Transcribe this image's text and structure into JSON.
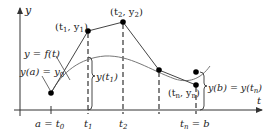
{
  "diagram": {
    "type": "euler-method-illustration",
    "axes": {
      "y_label": "y",
      "x_label": "t"
    },
    "ticks": {
      "t0": "a = t",
      "t0_sub": "0",
      "t1": "t",
      "t1_sub": "1",
      "t2": "t",
      "t2_sub": "2",
      "tn": "t",
      "tn_sub": "n",
      "tn_suffix": " = b"
    },
    "labels": {
      "curve": "y = f(t)",
      "initial": "y(a) = y",
      "initial_sub": "0",
      "point1": "(t",
      "point1_sub1": "1",
      "point1_mid": ", y",
      "point1_sub2": "1",
      "point1_end": ")",
      "point2": "(t",
      "point2_sub1": "2",
      "point2_mid": ", y",
      "point2_sub2": "2",
      "point2_end": ")",
      "pointn": "(t",
      "pointn_sub1": "n",
      "pointn_mid": ", y",
      "pointn_sub2": "n",
      "pointn_end": ")",
      "brace1": "y(t",
      "brace1_sub": "1",
      "brace1_end": ")",
      "brace_end": "y(b) = y(t",
      "brace_end_sub": "n",
      "brace_end_end": ")"
    },
    "colors": {
      "axis": "#333333",
      "polyline": "#444444",
      "curve": "#777777",
      "points": "#000000",
      "dashed": "#333333"
    }
  }
}
